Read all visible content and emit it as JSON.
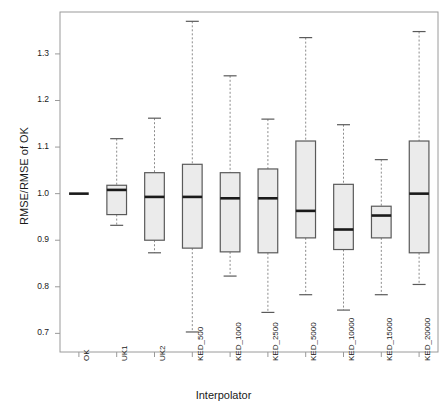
{
  "chart_data": {
    "type": "box",
    "title": "",
    "xlabel": "Interpolator",
    "ylabel": "RMSE/RMSE of OK",
    "ylim": [
      0.66,
      1.39
    ],
    "ytick_values": [
      0.7,
      0.8,
      0.9,
      1.0,
      1.1,
      1.2,
      1.3
    ],
    "ytick_labels": [
      "0.7",
      "0.8",
      "0.9",
      "1.0",
      "1.1",
      "1.2",
      "1.3"
    ],
    "grid": false,
    "legend": "none",
    "categories": [
      "OK",
      "UK1",
      "UK2",
      "KED_500",
      "KED_1000",
      "KED_2500",
      "KED_5000",
      "KED_10000",
      "KED_15000",
      "KED_20000"
    ],
    "boxes": [
      {
        "category": "OK",
        "whisker_low": 1.0,
        "q1": 1.0,
        "median": 1.0,
        "q3": 1.0,
        "whisker_high": 1.0,
        "degenerate": true
      },
      {
        "category": "UK1",
        "whisker_low": 0.932,
        "q1": 0.955,
        "median": 1.008,
        "q3": 1.018,
        "whisker_high": 1.118,
        "degenerate": false
      },
      {
        "category": "UK2",
        "whisker_low": 0.873,
        "q1": 0.9,
        "median": 0.993,
        "q3": 1.045,
        "whisker_high": 1.162,
        "degenerate": false
      },
      {
        "category": "KED_500",
        "whisker_low": 0.703,
        "q1": 0.883,
        "median": 0.993,
        "q3": 1.063,
        "whisker_high": 1.37,
        "degenerate": false
      },
      {
        "category": "KED_1000",
        "whisker_low": 0.823,
        "q1": 0.875,
        "median": 0.99,
        "q3": 1.045,
        "whisker_high": 1.253,
        "degenerate": false
      },
      {
        "category": "KED_2500",
        "whisker_low": 0.745,
        "q1": 0.873,
        "median": 0.99,
        "q3": 1.053,
        "whisker_high": 1.16,
        "degenerate": false
      },
      {
        "category": "KED_5000",
        "whisker_low": 0.783,
        "q1": 0.905,
        "median": 0.963,
        "q3": 1.113,
        "whisker_high": 1.335,
        "degenerate": false
      },
      {
        "category": "KED_10000",
        "whisker_low": 0.75,
        "q1": 0.88,
        "median": 0.923,
        "q3": 1.02,
        "whisker_high": 1.148,
        "degenerate": false
      },
      {
        "category": "KED_15000",
        "whisker_low": 0.783,
        "q1": 0.905,
        "median": 0.953,
        "q3": 0.973,
        "whisker_high": 1.073,
        "degenerate": false
      },
      {
        "category": "KED_20000",
        "whisker_low": 0.805,
        "q1": 0.873,
        "median": 1.0,
        "q3": 1.113,
        "whisker_high": 1.348,
        "degenerate": false
      }
    ],
    "style": {
      "box_fill": "#ebebeb",
      "box_stroke": "#5a5a5a",
      "median_stroke": "#1a1a1a",
      "whisker_stroke": "#8c8c8c",
      "axis_stroke": "#9a9a9a",
      "panel_border": "#9a9a9a"
    }
  }
}
